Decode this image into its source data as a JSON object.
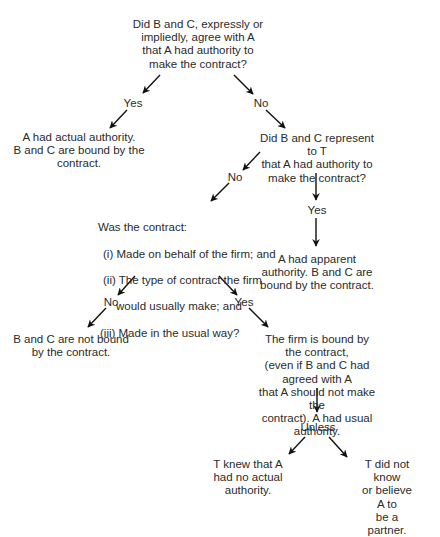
{
  "diagram": {
    "type": "decision-flowchart",
    "text_color": "#2b2b2b",
    "arrow_color": "#111111",
    "background": "#ffffff",
    "nodes": {
      "q1": "Did B and C, expressly or\nimpliedly, agree with A\nthat A had authority to\nmake the contract?",
      "actual_authority": "A had actual authority.\nB and C are bound by the\ncontract.",
      "q2": "Did B and C represent to T\nthat A had authority to\nmake the contract?",
      "q3": {
        "title": "Was the contract:",
        "items": [
          "(i) Made on behalf of the firm; and",
          "(ii) The type of contract the firm",
          "would usually make; and",
          "(iii) Made in the usual way?"
        ]
      },
      "apparent_authority": "A had apparent\nauthority. B and C are\nbound by the contract.",
      "not_bound": "B and C are not bound\nby the contract.",
      "usual_authority": "The firm is bound by the contract,\n(even if B and C had agreed with A\nthat A should not make the\ncontract). A had usual authority.",
      "unless": "Unless",
      "knew_no_authority": "T knew that A\nhad no actual\nauthority.",
      "did_not_know_partner": "T did not know\nor believe A to\nbe a partner."
    },
    "edge_labels": {
      "q1_yes": "Yes",
      "q1_no": "No",
      "q2_no": "No",
      "q2_yes": "Yes",
      "q3_no": "No",
      "q3_yes": "Yes"
    },
    "edges": [
      {
        "from": "q1",
        "to": "actual_authority",
        "label": "Yes"
      },
      {
        "from": "q1",
        "to": "q2",
        "label": "No"
      },
      {
        "from": "q2",
        "to": "q3",
        "label": "No"
      },
      {
        "from": "q2",
        "to": "apparent_authority",
        "label": "Yes"
      },
      {
        "from": "q3",
        "to": "not_bound",
        "label": "No"
      },
      {
        "from": "q3",
        "to": "usual_authority",
        "label": "Yes"
      },
      {
        "from": "usual_authority",
        "to": "unless",
        "label": ""
      },
      {
        "from": "unless",
        "to": "knew_no_authority",
        "label": ""
      },
      {
        "from": "unless",
        "to": "did_not_know_partner",
        "label": ""
      }
    ]
  }
}
